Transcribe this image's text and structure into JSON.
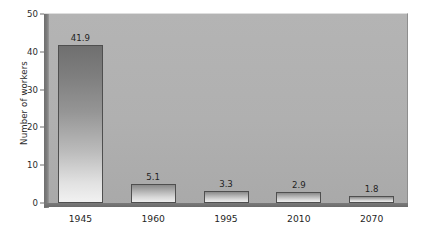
{
  "chart_data": {
    "type": "bar",
    "title": "",
    "xlabel": "",
    "ylabel": "Number of workers",
    "categories": [
      "1945",
      "1960",
      "1995",
      "2010",
      "2070"
    ],
    "values": [
      41.9,
      5.1,
      3.3,
      2.9,
      1.8
    ],
    "value_labels": [
      "41.9",
      "5.1",
      "3.3",
      "2.9",
      "1.8"
    ],
    "ylim": [
      0,
      50
    ],
    "yticks": [
      0,
      10,
      20,
      30,
      40,
      50
    ],
    "ytick_labels": [
      "0",
      "10",
      "20",
      "30",
      "40",
      "50"
    ],
    "grid": false,
    "legend": null,
    "legend_position": "none",
    "colors": {
      "plot_background": "#b0b0b0",
      "page_background": "#ffffff",
      "bar_top": "#6f6f6f",
      "bar_bottom": "#f1f1f1",
      "bar_border": "#4f4f4f",
      "axis": "#6e6e6e",
      "text": "#1f1f1f"
    }
  }
}
